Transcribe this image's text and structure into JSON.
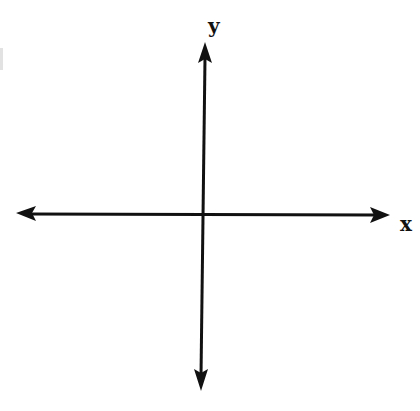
{
  "diagram": {
    "type": "cartesian-axes",
    "axes": {
      "x": {
        "label": "x",
        "direction": "bidirectional"
      },
      "y": {
        "label": "y",
        "direction": "bidirectional"
      }
    },
    "colors": {
      "axis": "#111111",
      "background": "#ffffff"
    }
  }
}
